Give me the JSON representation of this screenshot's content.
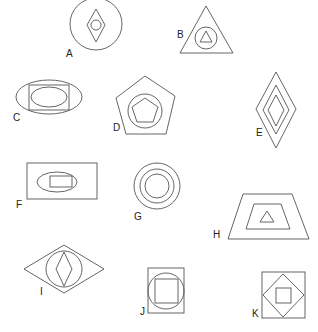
{
  "diagram": {
    "stroke_color": "#555555",
    "label_color": "#222222",
    "figures": [
      {
        "id": "A",
        "label": "A",
        "label_pos": [
          66,
          57
        ],
        "description": "circle containing a diamond containing a small circle",
        "shapes": [
          {
            "type": "circle",
            "cx": 96,
            "cy": 24,
            "r": 26
          },
          {
            "type": "polygon",
            "points": [
              [
                96,
                9
              ],
              [
                105,
                25
              ],
              [
                96,
                42
              ],
              [
                87,
                25
              ]
            ]
          },
          {
            "type": "circle",
            "cx": 96,
            "cy": 25,
            "r": 5
          }
        ]
      },
      {
        "id": "B",
        "label": "B",
        "label_pos": [
          177,
          38
        ],
        "description": "triangle containing a circle containing a small triangle",
        "shapes": [
          {
            "type": "polygon",
            "points": [
              [
                206,
                6
              ],
              [
                233,
                53
              ],
              [
                180,
                53
              ]
            ]
          },
          {
            "type": "circle",
            "cx": 206,
            "cy": 38,
            "r": 11
          },
          {
            "type": "polygon",
            "points": [
              [
                206,
                31
              ],
              [
                212,
                42
              ],
              [
                200,
                42
              ]
            ]
          }
        ]
      },
      {
        "id": "C",
        "label": "C",
        "label_pos": [
          13,
          121
        ],
        "description": "ellipse containing a rectangle containing an ellipse",
        "shapes": [
          {
            "type": "ellipse",
            "cx": 49,
            "cy": 97,
            "rx": 33,
            "ry": 17
          },
          {
            "type": "rect",
            "x": 29,
            "y": 85,
            "w": 40,
            "h": 25
          },
          {
            "type": "ellipse",
            "cx": 49,
            "cy": 97,
            "rx": 18,
            "ry": 10
          }
        ]
      },
      {
        "id": "D",
        "label": "D",
        "label_pos": [
          113,
          131
        ],
        "description": "pentagon containing a circle containing a pentagon",
        "shapes": [
          {
            "type": "polygon",
            "points": [
              [
                145,
                76
              ],
              [
                175,
                96
              ],
              [
                166,
                134
              ],
              [
                126,
                134
              ],
              [
                116,
                98
              ]
            ]
          },
          {
            "type": "circle",
            "cx": 145,
            "cy": 111,
            "r": 17
          },
          {
            "type": "polygon",
            "points": [
              [
                145,
                98
              ],
              [
                158,
                107
              ],
              [
                153,
                122
              ],
              [
                137,
                122
              ],
              [
                132,
                107
              ]
            ]
          }
        ]
      },
      {
        "id": "E",
        "label": "E",
        "label_pos": [
          256,
          136
        ],
        "description": "three nested diamonds",
        "shapes": [
          {
            "type": "polygon",
            "points": [
              [
                276,
                72
              ],
              [
                296,
                109
              ],
              [
                276,
                148
              ],
              [
                256,
                109
              ]
            ]
          },
          {
            "type": "polygon",
            "points": [
              [
                276,
                85
              ],
              [
                289,
                110
              ],
              [
                276,
                134
              ],
              [
                263,
                110
              ]
            ]
          },
          {
            "type": "polygon",
            "points": [
              [
                276,
                95
              ],
              [
                284,
                110
              ],
              [
                276,
                126
              ],
              [
                268,
                110
              ]
            ]
          }
        ]
      },
      {
        "id": "F",
        "label": "F",
        "label_pos": [
          16,
          208
        ],
        "description": "rectangle containing an ellipse containing a rectangle",
        "shapes": [
          {
            "type": "rect",
            "x": 27,
            "y": 163,
            "w": 70,
            "h": 36
          },
          {
            "type": "ellipse",
            "cx": 57,
            "cy": 182,
            "rx": 20,
            "ry": 10
          },
          {
            "type": "rect",
            "x": 50,
            "y": 176,
            "w": 22,
            "h": 11
          }
        ]
      },
      {
        "id": "G",
        "label": "G",
        "label_pos": [
          134,
          220
        ],
        "description": "three concentric circles",
        "shapes": [
          {
            "type": "circle",
            "cx": 157,
            "cy": 186,
            "r": 23
          },
          {
            "type": "circle",
            "cx": 157,
            "cy": 186,
            "r": 17
          },
          {
            "type": "circle",
            "cx": 157,
            "cy": 186,
            "r": 12
          }
        ]
      },
      {
        "id": "H",
        "label": "H",
        "label_pos": [
          213,
          238
        ],
        "description": "trapezoid containing a trapezoid containing a triangle",
        "shapes": [
          {
            "type": "polygon",
            "points": [
              [
                243,
                194
              ],
              [
                292,
                194
              ],
              [
                309,
                239
              ],
              [
                228,
                239
              ]
            ]
          },
          {
            "type": "polygon",
            "points": [
              [
                254,
                204
              ],
              [
                281,
                204
              ],
              [
                290,
                229
              ],
              [
                246,
                229
              ]
            ]
          },
          {
            "type": "polygon",
            "points": [
              [
                267,
                211
              ],
              [
                274,
                222
              ],
              [
                260,
                222
              ]
            ]
          }
        ]
      },
      {
        "id": "I",
        "label": "I",
        "label_pos": [
          40,
          295
        ],
        "description": "wide diamond containing a circle containing a narrow diamond",
        "shapes": [
          {
            "type": "polygon",
            "points": [
              [
                64,
                245
              ],
              [
                104,
                269
              ],
              [
                64,
                293
              ],
              [
                24,
                269
              ]
            ]
          },
          {
            "type": "circle",
            "cx": 64,
            "cy": 269,
            "r": 18
          },
          {
            "type": "polygon",
            "points": [
              [
                64,
                252
              ],
              [
                72,
                269
              ],
              [
                64,
                286
              ],
              [
                56,
                269
              ]
            ]
          }
        ]
      },
      {
        "id": "J",
        "label": "J",
        "label_pos": [
          140,
          315
        ],
        "description": "square containing a circle containing a square",
        "shapes": [
          {
            "type": "rect",
            "x": 148,
            "y": 268,
            "w": 36,
            "h": 45
          },
          {
            "type": "circle",
            "cx": 166,
            "cy": 291,
            "r": 18
          },
          {
            "type": "rect",
            "x": 155,
            "y": 279,
            "w": 23,
            "h": 24
          }
        ]
      },
      {
        "id": "K",
        "label": "K",
        "label_pos": [
          252,
          317
        ],
        "description": "square containing a diamond containing a square",
        "shapes": [
          {
            "type": "rect",
            "x": 262,
            "y": 272,
            "w": 43,
            "h": 46
          },
          {
            "type": "polygon",
            "points": [
              [
                283,
                274
              ],
              [
                304,
                295
              ],
              [
                283,
                317
              ],
              [
                263,
                295
              ]
            ]
          },
          {
            "type": "rect",
            "x": 276,
            "y": 288,
            "w": 15,
            "h": 15
          }
        ]
      }
    ]
  }
}
